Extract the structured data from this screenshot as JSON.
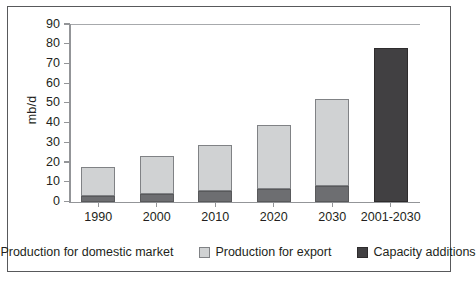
{
  "chart_data": {
    "type": "bar",
    "subtype": "stacked-bar",
    "title": "",
    "xlabel": "",
    "ylabel": "mb/d",
    "ylim": [
      0,
      90
    ],
    "ytick_step": 10,
    "yticks": [
      "0",
      "10",
      "20",
      "30",
      "40",
      "50",
      "60",
      "70",
      "80",
      "90"
    ],
    "grid": false,
    "legend_position": "bottom",
    "categories": [
      "1990",
      "2000",
      "2010",
      "2020",
      "2030",
      "2001-2030"
    ],
    "series": [
      {
        "name": "Production for domestic market",
        "color": "#6d6e71",
        "values": [
          3,
          4,
          5.5,
          6.5,
          8,
          null
        ]
      },
      {
        "name": "Production for export",
        "color": "#d0d2d3",
        "values": [
          14.5,
          19,
          23,
          32.5,
          44,
          null
        ]
      },
      {
        "name": "Capacity additions",
        "color": "#414042",
        "values": [
          null,
          null,
          null,
          null,
          null,
          78
        ]
      }
    ],
    "totals": [
      17.5,
      23,
      28.5,
      39,
      52,
      78
    ]
  },
  "legend": {
    "items": [
      {
        "label": "Production for domestic market",
        "swatch": "sw-domestic"
      },
      {
        "label": "Production for export",
        "swatch": "sw-export"
      },
      {
        "label": "Capacity additions",
        "swatch": "sw-capacity"
      }
    ]
  }
}
